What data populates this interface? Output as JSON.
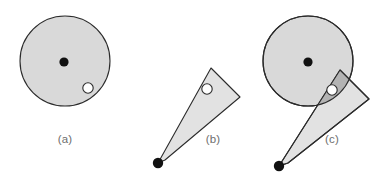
{
  "figure": {
    "canvas": {
      "width": 382,
      "height": 178,
      "background": "#ffffff"
    },
    "style": {
      "disc_fill": "#d9d9d9",
      "wedge_fill": "#e2e2e2",
      "overlap_fill": "#b3b3b3",
      "stroke": "#2b2b2b",
      "stroke_width": 1.1,
      "dot_fill": "#111111",
      "hole_fill": "#ffffff",
      "label_color": "#6e6e6e",
      "label_font_size": 11.5
    },
    "panels": [
      {
        "id": "a",
        "label": "(a)",
        "label_x": 65,
        "label_y": 140,
        "description": "shaded disc with centre dot and small open circle",
        "disc": {
          "cx": 65,
          "cy": 61,
          "r": 45
        },
        "center_dot": {
          "cx": 64,
          "cy": 62,
          "r": 4.6
        },
        "hole": {
          "cx": 88,
          "cy": 88,
          "r": 5.2
        }
      },
      {
        "id": "b",
        "label": "(b)",
        "label_x": 213,
        "label_y": 140,
        "description": "shaded wedge from apex dot with small open circle",
        "apex_dot": {
          "cx": 158,
          "cy": 163,
          "r": 5.2
        },
        "wedge_points": "158,163 211,68 240,97 165,160",
        "hole": {
          "cx": 207,
          "cy": 89,
          "r": 5.2
        }
      },
      {
        "id": "c",
        "label": "(c)",
        "label_x": 332,
        "label_y": 140,
        "description": "disc and wedge overlapping, intersection shaded darker",
        "disc": {
          "cx": 308,
          "cy": 61,
          "r": 45
        },
        "center_dot": {
          "cx": 308,
          "cy": 62,
          "r": 4.6
        },
        "apex_dot": {
          "cx": 279,
          "cy": 166,
          "r": 5.2
        },
        "wedge_points": "279,166 340,70 369,99 288,163",
        "hole": {
          "cx": 332,
          "cy": 90,
          "r": 5.2
        }
      }
    ]
  }
}
